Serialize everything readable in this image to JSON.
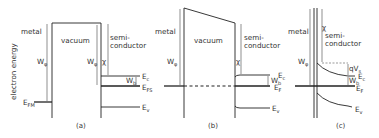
{
  "figure": {
    "y_axis_label": "electron energy",
    "panels": [
      {
        "id": "a",
        "caption": "(a)",
        "regions": {
          "metal": "metal",
          "vacuum": "vacuum",
          "semiconductor_line1": "semi-",
          "semiconductor_line2": "conductor"
        },
        "labels": {
          "work_function_metal": "W",
          "work_function_metal_sub": "φ",
          "work_function_semi": "W",
          "work_function_semi_sub": "φ",
          "work_function_semi_prime": "'",
          "electron_affinity": "χ",
          "fermi_metal": "E",
          "fermi_metal_sub": "FM",
          "conduction_band": "E",
          "conduction_band_sub": "c",
          "fermi_semi": "E",
          "fermi_semi_sub": "FS",
          "valence_band": "E",
          "valence_band_sub": "v",
          "wb": "W",
          "wb_sub": "b"
        }
      },
      {
        "id": "b",
        "caption": "(b)",
        "regions": {
          "metal": "metal",
          "vacuum": "vacuum",
          "semiconductor_line1": "semi-",
          "semiconductor_line2": "conductor"
        },
        "labels": {
          "work_function_metal": "W",
          "work_function_metal_sub": "φ",
          "electron_affinity": "χ",
          "conduction_band": "E",
          "conduction_band_sub": "c",
          "fermi": "E",
          "fermi_sub": "F",
          "valence_band": "E",
          "valence_band_sub": "v",
          "wb": "W",
          "wb_sub": "b"
        }
      },
      {
        "id": "c",
        "caption": "(c)",
        "regions": {
          "metal": "metal",
          "semiconductor_line1": "semi-",
          "semiconductor_line2": "conductor"
        },
        "labels": {
          "work_function_metal": "W",
          "work_function_metal_sub": "φ",
          "electron_affinity": "χ",
          "band_bending": "qV",
          "band_bending_sub": "s",
          "conduction_band": "E",
          "conduction_band_sub": "c",
          "fermi": "E",
          "fermi_sub": "F",
          "valence_band": "E",
          "valence_band_sub": "v",
          "wb": "W",
          "wb_sub": "b"
        }
      }
    ]
  }
}
